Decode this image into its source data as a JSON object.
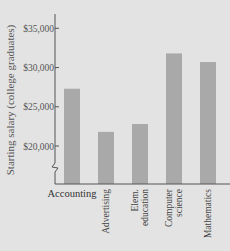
{
  "chart_data": {
    "type": "bar",
    "title": "",
    "xlabel": "",
    "ylabel": "Starting salary (college graduates)",
    "categories": [
      "Accounting",
      "Advertising",
      "Elem. education",
      "Computer science",
      "Mathematics"
    ],
    "category_label_lines": [
      [
        "Accounting"
      ],
      [
        "Advertising"
      ],
      [
        "Elem.",
        "education"
      ],
      [
        "Computer",
        "science"
      ],
      [
        "Mathematics"
      ]
    ],
    "values": [
      27300,
      21800,
      22800,
      31800,
      30700
    ],
    "yticks": [
      20000,
      25000,
      30000,
      35000
    ],
    "ytick_labels": [
      "$20,000",
      "$25,000",
      "$30,000",
      "$35,000"
    ],
    "ylim": [
      17000,
      37000
    ],
    "axis_break": true,
    "grid": false,
    "legend": null,
    "colors": {
      "bar": "#a9a9a9",
      "background": "#e3e3e3",
      "axis": "#555555"
    }
  }
}
